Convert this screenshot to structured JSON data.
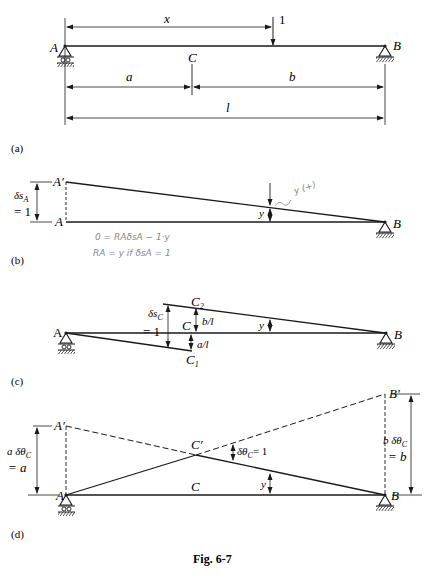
{
  "figure": {
    "caption": "Fig. 6-7",
    "panels": {
      "a": {
        "tag": "(a)",
        "support_left": "A",
        "support_right": "B",
        "point_c": "C",
        "load_value": "1",
        "dim_x": "x",
        "dim_a": "a",
        "dim_b": "b",
        "dim_l": "l"
      },
      "b": {
        "tag": "(b)",
        "point_a_displaced": "A′",
        "point_a": "A",
        "point_b": "B",
        "ordinate_y": "y",
        "disp_label_top": "δs",
        "disp_label_sub": "A",
        "disp_label_eq": "= 1",
        "handwritten_note": "y (+)",
        "handwritten_eq1": "0 = RAδsA − 1·y",
        "handwritten_eq2": "RA = y if δsA = 1"
      },
      "c": {
        "tag": "(c)",
        "point_a": "A",
        "point_b": "B",
        "point_c": "C",
        "point_c1": "C",
        "point_c1_sub": "1",
        "point_c2": "C",
        "point_c2_sub": "2",
        "disp_label_top": "δs",
        "disp_label_sub": "C",
        "disp_label_eq": "= 1",
        "upper_ordinate": "b/l",
        "lower_ordinate": "a/l",
        "ordinate_y": "y"
      },
      "d": {
        "tag": "(d)",
        "point_a_displaced": "A′",
        "point_b_displaced": "B′",
        "point_c_displaced": "C′",
        "point_a": "A",
        "point_b": "B",
        "point_c": "C",
        "ordinate_y": "y",
        "rotation_label": "δθ",
        "rotation_sub": "C",
        "rotation_eq": "= 1",
        "left_label_1": "a δθ",
        "left_label_sub": "C",
        "left_label_2": "= a",
        "right_label_1": "b δθ",
        "right_label_sub": "C",
        "right_label_2": "= b"
      }
    }
  }
}
